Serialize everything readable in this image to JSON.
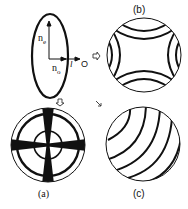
{
  "diagram": {
    "indicatrix": {
      "ne_label": "n",
      "ne_sub": "e",
      "no_label": "n",
      "no_sub": "o",
      "light_dir_label": "l",
      "observer_label": "O"
    },
    "panels": {
      "a": {
        "caption": "(a)",
        "description": "uniaxial interference figure with isogyre cross and circular isochromes"
      },
      "b": {
        "caption": "(b)",
        "description": "biaxial-style hyperbolic isochromes"
      },
      "c": {
        "caption": "(c)",
        "description": "off-centred inclined arc isochromes"
      }
    },
    "arrows": [
      "down-to-a",
      "right-to-b",
      "diag-to-c"
    ],
    "colors": {
      "ink": "#111111",
      "background": "#ffffff"
    }
  }
}
